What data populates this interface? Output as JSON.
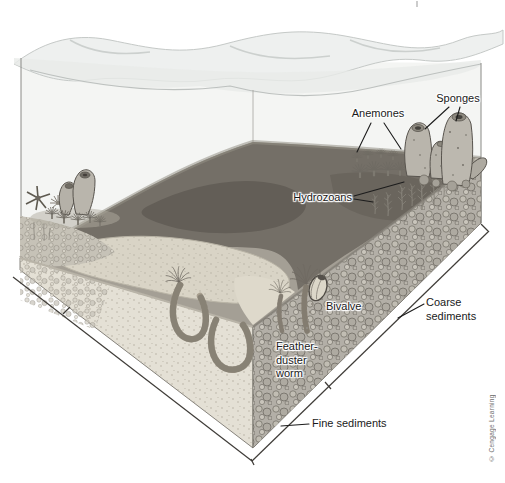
{
  "figure": {
    "credit": "© Cengage Learning",
    "labels": {
      "anemones": "Anemones",
      "sponges": "Sponges",
      "hydrozoans": "Hydrozoans",
      "bivalve": "Bivalve",
      "feather_duster_worm_lines": [
        "Feather-",
        "duster",
        "worm"
      ],
      "coarse_sediments_lines": [
        "Coarse",
        "sediments"
      ],
      "fine_sediments": "Fine sediments"
    },
    "colors": {
      "background": "#ffffff",
      "label_text": "#1a1a1a",
      "label_halo": "#ffffff",
      "credit_text": "#6e6e6e",
      "water_surface": "#eef0ef",
      "seafloor_mud": "#746f67",
      "sand_patch": "#d9d4c6",
      "fine_sediment_face": "#e4e0d5",
      "coarse_sediment_face": "#b3afa7",
      "leader_line": "#1c1c1c"
    }
  }
}
